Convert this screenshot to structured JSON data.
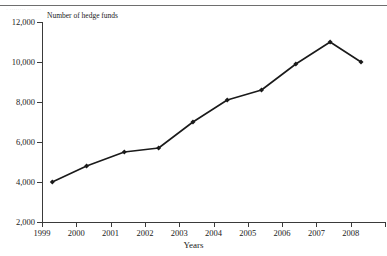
{
  "figure": {
    "top_rule": true,
    "ghost_caption_left": "··",
    "ghost_caption_right": "··",
    "ghost_row2": "· ········ ·······"
  },
  "chart_data": {
    "type": "line",
    "title": "",
    "xlabel": "Years",
    "ylabel": "Number of hedge funds",
    "x": [
      1999.3,
      2000.3,
      2001.4,
      2002.4,
      2003.4,
      2004.4,
      2005.4,
      2006.4,
      2007.4,
      2008.3
    ],
    "values": [
      4000,
      4800,
      5500,
      5700,
      7000,
      8100,
      8600,
      9900,
      11000,
      10000
    ],
    "series": [
      {
        "name": "Number of hedge funds",
        "values": [
          4000,
          4800,
          5500,
          5700,
          7000,
          8100,
          8600,
          9900,
          11000,
          10000
        ]
      }
    ],
    "ylim": [
      2000,
      12000
    ],
    "xlim": [
      1999,
      2009
    ],
    "ytick_values": [
      2000,
      4000,
      6000,
      8000,
      10000,
      12000
    ],
    "ytick_labels": [
      "2,000",
      "4,000",
      "6,000",
      "8,000",
      "10,000",
      "12,000"
    ],
    "xtick_values": [
      1999,
      2000,
      2001,
      2002,
      2003,
      2004,
      2005,
      2006,
      2007,
      2008
    ],
    "xtick_labels": [
      "1999",
      "2000",
      "2001",
      "2002",
      "2003",
      "2004",
      "2005",
      "2006",
      "2007",
      "2008"
    ],
    "grid": false,
    "legend": null,
    "legend_position": "none",
    "marker": "filled-diamond",
    "line_color": "#1a1a1a",
    "marker_color": "#1a1a1a",
    "line_width": 1.6,
    "annotations": []
  },
  "axes": {
    "y_axis_label": "Number of hedge funds",
    "x_axis_label": "Years"
  }
}
